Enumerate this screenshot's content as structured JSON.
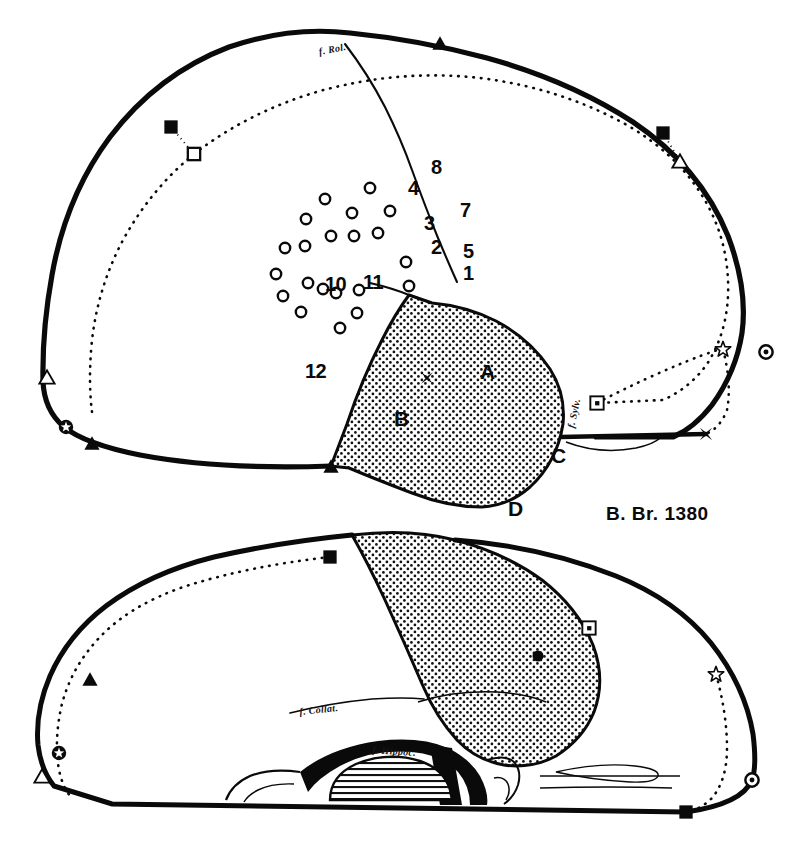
{
  "figure": {
    "case_caption": "B. Br. 1380",
    "background_color": "#ffffff",
    "ink_color": "#0a0a0a",
    "stipple_color": "#111111"
  },
  "upper_view": {
    "name": "lateral-view",
    "fissure_labels": [
      {
        "id": "rolandic",
        "text": "f. Rol.",
        "x": 320,
        "y": 46
      },
      {
        "id": "sylvian",
        "text": "f. Sylv.",
        "x": 576,
        "y": 418
      }
    ],
    "numbered_sites": [
      {
        "label": "8",
        "x": 431,
        "y": 156
      },
      {
        "label": "4",
        "x": 408,
        "y": 177
      },
      {
        "label": "7",
        "x": 460,
        "y": 199
      },
      {
        "label": "3",
        "x": 424,
        "y": 212
      },
      {
        "label": "2",
        "x": 431,
        "y": 236
      },
      {
        "label": "5",
        "x": 463,
        "y": 240
      },
      {
        "label": "1",
        "x": 463,
        "y": 262
      },
      {
        "label": "10",
        "x": 325,
        "y": 273
      },
      {
        "label": "11",
        "x": 363,
        "y": 271
      },
      {
        "label": "12",
        "x": 305,
        "y": 360
      }
    ],
    "stipple_regions": [
      {
        "label": "A",
        "x": 480,
        "y": 360
      },
      {
        "label": "B",
        "x": 394,
        "y": 407
      },
      {
        "label": "C",
        "x": 551,
        "y": 444
      },
      {
        "label": "D",
        "x": 508,
        "y": 497
      }
    ],
    "electrode_circles": [
      {
        "x": 325,
        "y": 199
      },
      {
        "x": 370,
        "y": 188
      },
      {
        "x": 352,
        "y": 213
      },
      {
        "x": 390,
        "y": 211
      },
      {
        "x": 306,
        "y": 219
      },
      {
        "x": 331,
        "y": 236
      },
      {
        "x": 354,
        "y": 236
      },
      {
        "x": 378,
        "y": 233
      },
      {
        "x": 285,
        "y": 248
      },
      {
        "x": 305,
        "y": 246
      },
      {
        "x": 406,
        "y": 262
      },
      {
        "x": 276,
        "y": 274
      },
      {
        "x": 308,
        "y": 283
      },
      {
        "x": 323,
        "y": 289
      },
      {
        "x": 336,
        "y": 293
      },
      {
        "x": 409,
        "y": 286
      },
      {
        "x": 283,
        "y": 296
      },
      {
        "x": 359,
        "y": 290
      },
      {
        "x": 301,
        "y": 312
      },
      {
        "x": 357,
        "y": 313
      },
      {
        "x": 340,
        "y": 328
      }
    ],
    "cross_marker": {
      "x": 427,
      "y": 378
    },
    "boundary_markers": [
      {
        "type": "triangle-filled",
        "x": 440,
        "y": 43
      },
      {
        "type": "square-filled",
        "x": 171,
        "y": 127
      },
      {
        "type": "square-open",
        "x": 194,
        "y": 154
      },
      {
        "type": "square-filled",
        "x": 663,
        "y": 133
      },
      {
        "type": "triangle-open",
        "x": 680,
        "y": 161
      },
      {
        "type": "star-open",
        "x": 723,
        "y": 349
      },
      {
        "type": "circle-dot",
        "x": 766,
        "y": 352
      },
      {
        "type": "square-dot",
        "x": 597,
        "y": 403
      },
      {
        "type": "cross-filled",
        "x": 706,
        "y": 434
      },
      {
        "type": "triangle-open",
        "x": 47,
        "y": 377
      },
      {
        "type": "star-circled",
        "x": 66,
        "y": 427
      },
      {
        "type": "triangle-filled",
        "x": 92,
        "y": 443
      },
      {
        "type": "triangle-filled",
        "x": 331,
        "y": 466
      }
    ]
  },
  "lower_view": {
    "name": "medial-basal-view",
    "fissure_labels": [
      {
        "id": "collateral",
        "text": "f. Collat.",
        "x": 300,
        "y": 706
      },
      {
        "id": "hippocampal",
        "text": "f. Hippoc.",
        "x": 372,
        "y": 744
      }
    ],
    "boundary_markers": [
      {
        "type": "square-filled",
        "x": 330,
        "y": 557
      },
      {
        "type": "triangle-filled",
        "x": 90,
        "y": 679
      },
      {
        "type": "star-circled",
        "x": 59,
        "y": 753
      },
      {
        "type": "triangle-open",
        "x": 42,
        "y": 776
      },
      {
        "type": "square-dot",
        "x": 589,
        "y": 628
      },
      {
        "type": "circle-filled",
        "x": 538,
        "y": 656
      },
      {
        "type": "star-open",
        "x": 716,
        "y": 674
      },
      {
        "type": "circle-dot",
        "x": 752,
        "y": 780
      },
      {
        "type": "square-filled",
        "x": 686,
        "y": 812
      }
    ]
  }
}
